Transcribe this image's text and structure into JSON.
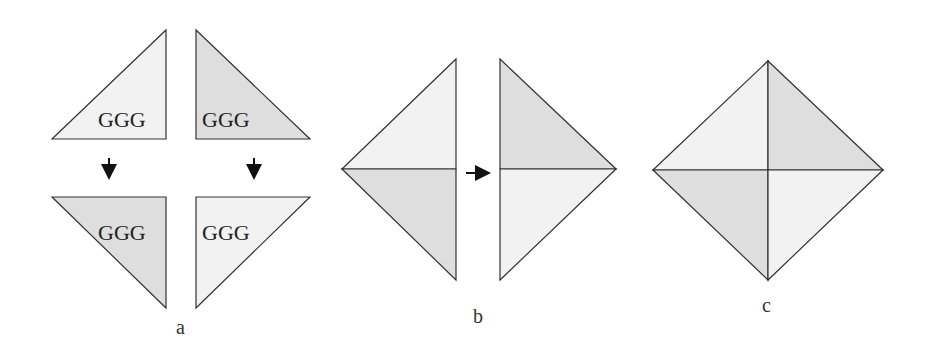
{
  "colors": {
    "light_fill": "#f2f2f2",
    "dark_fill": "#dedede",
    "stroke": "#333333",
    "arrow": "#111111"
  },
  "panel_a": {
    "label": "a",
    "triangles": [
      {
        "text": "GGG",
        "shade": "light",
        "position": "top-left"
      },
      {
        "text": "GGG",
        "shade": "dark",
        "position": "top-right"
      },
      {
        "text": "GGG",
        "shade": "dark",
        "position": "bottom-left"
      },
      {
        "text": "GGG",
        "shade": "light",
        "position": "bottom-right"
      }
    ],
    "arrows": [
      "down-arrow",
      "down-arrow"
    ]
  },
  "panel_b": {
    "label": "b",
    "arrow": "right-arrow"
  },
  "panel_c": {
    "label": "c"
  }
}
